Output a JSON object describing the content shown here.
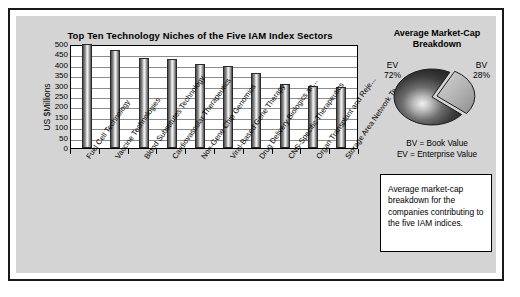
{
  "chart_data": [
    {
      "type": "bar",
      "title": "Top Ten Technology Niches of the Five IAM Index Sectors",
      "xlabel": "",
      "ylabel": "US $Millions",
      "ylim": [
        0,
        500
      ],
      "yticks": [
        500,
        450,
        400,
        350,
        300,
        250,
        200,
        150,
        100,
        50,
        0
      ],
      "grid": true,
      "legend": "none",
      "categories": [
        "Fuel Cell Technology",
        "Vaccine Technologies",
        "Blood Substitutes Technology",
        "Cardiovascular Therapeutics",
        "Non-Gene Chip Genomics",
        "Viral-Based Gene Therapy",
        "Drug Delivery Biologics an...",
        "CNS-Specific Therapeutics",
        "Organ Transplant and Reje...",
        "Storage Area Network Te..."
      ],
      "values": [
        500,
        470,
        435,
        430,
        403,
        396,
        360,
        308,
        298,
        292
      ]
    },
    {
      "type": "pie",
      "title": "Average Market-Cap Breakdown",
      "labels": [
        "EV",
        "BV"
      ],
      "values": [
        72,
        28
      ],
      "value_labels": [
        "72%",
        "28%"
      ],
      "exploded": [
        "BV"
      ],
      "colors": [
        "#3a3a3a",
        "#b5b5b5"
      ],
      "legend": [
        "BV = Book Value",
        "EV = Enterprise Value"
      ]
    }
  ],
  "bar_chart": {
    "title": "Top Ten Technology Niches of the Five IAM Index Sectors",
    "y_axis_label": "US $Millions",
    "y_ticks": [
      "500",
      "450",
      "400",
      "350",
      "300",
      "250",
      "200",
      "150",
      "100",
      "50",
      "0"
    ],
    "bars": [
      {
        "label": "Fuel Cell Technology",
        "value": 500
      },
      {
        "label": "Vaccine Technologies",
        "value": 470
      },
      {
        "label": "Blood Substitutes Technology",
        "value": 435
      },
      {
        "label": "Cardiovascular Therapeutics",
        "value": 430
      },
      {
        "label": "Non-Gene Chip Genomics",
        "value": 403
      },
      {
        "label": "Viral-Based Gene Therapy",
        "value": 396
      },
      {
        "label": "Drug Delivery Biologics an...",
        "value": 360
      },
      {
        "label": "CNS-Specific Therapeutics",
        "value": 308
      },
      {
        "label": "Organ Transplant and Reje...",
        "value": 298
      },
      {
        "label": "Storage Area Network Te...",
        "value": 292
      }
    ]
  },
  "pie_chart": {
    "title_line1": "Average Market-Cap",
    "title_line2": "Breakdown",
    "slices": [
      {
        "name": "EV",
        "percent_label": "72%",
        "value": 72,
        "color": "#3a3a3a"
      },
      {
        "name": "BV",
        "percent_label": "28%",
        "value": 28,
        "color": "#b5b5b5"
      }
    ],
    "legend_line1": "BV = Book Value",
    "legend_line2": "EV = Enterprise Value"
  },
  "callout": {
    "text": "Average market-cap breakdown for the companies contributing to the five IAM indices."
  }
}
